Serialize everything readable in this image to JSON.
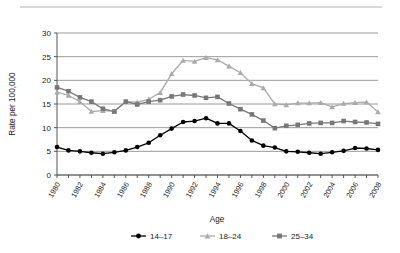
{
  "chart_data": {
    "type": "line",
    "title": "",
    "xlabel": "Age",
    "ylabel": "Rate per 100,000",
    "x": [
      1980,
      1981,
      1982,
      1983,
      1984,
      1985,
      1986,
      1987,
      1988,
      1989,
      1990,
      1991,
      1992,
      1993,
      1994,
      1995,
      1996,
      1997,
      1998,
      1999,
      2000,
      2001,
      2002,
      2003,
      2004,
      2005,
      2006,
      2007,
      2008
    ],
    "xlim": [
      1980,
      2008
    ],
    "ylim": [
      0,
      30
    ],
    "yticks": [
      0,
      5,
      10,
      15,
      20,
      25,
      30
    ],
    "xticks": [
      1980,
      1982,
      1984,
      1986,
      1988,
      1990,
      1992,
      1994,
      1996,
      1998,
      2000,
      2002,
      2004,
      2006,
      2008
    ],
    "xtick_labels": [
      "1980",
      "1982",
      "1984",
      "1986",
      "1988",
      "1990",
      "1992",
      "1994",
      "1996",
      "1998",
      "2000",
      "2002",
      "2004",
      "2006",
      "2008"
    ],
    "ytick_labels": [
      "0",
      "5",
      "10",
      "15",
      "20",
      "25",
      "30"
    ],
    "grid": "horizontal",
    "legend_position": "bottom",
    "series": [
      {
        "name": "14–17",
        "color": "#000000",
        "marker": "circle",
        "values": [
          5.9,
          5.2,
          5.0,
          4.7,
          4.5,
          4.8,
          5.2,
          5.9,
          6.8,
          8.4,
          9.8,
          11.2,
          11.4,
          12.0,
          10.9,
          10.9,
          9.3,
          7.3,
          6.2,
          5.8,
          5.0,
          4.9,
          4.7,
          4.5,
          4.8,
          5.1,
          5.7,
          5.6,
          5.3
        ]
      },
      {
        "name": "18–24",
        "color": "#aaaaaa",
        "marker": "triangle",
        "values": [
          17.5,
          16.8,
          15.5,
          13.4,
          13.6,
          13.5,
          15.5,
          15.4,
          16.0,
          17.4,
          21.4,
          24.2,
          24.0,
          24.8,
          24.3,
          23.0,
          21.6,
          19.3,
          18.4,
          15.0,
          14.8,
          15.2,
          15.2,
          15.3,
          14.4,
          15.1,
          15.3,
          15.4,
          13.3
        ]
      },
      {
        "name": "25–34",
        "color": "#777777",
        "marker": "square",
        "values": [
          18.5,
          17.7,
          16.4,
          15.5,
          14.0,
          13.4,
          15.5,
          14.9,
          15.5,
          15.8,
          16.6,
          17.0,
          16.8,
          16.3,
          16.5,
          15.1,
          13.9,
          12.8,
          11.5,
          9.9,
          10.4,
          10.6,
          10.9,
          11.0,
          11.0,
          11.4,
          11.2,
          11.1,
          10.8
        ]
      }
    ]
  },
  "axis": {
    "y_title": "Rate per 100,000",
    "x_title": "Age"
  },
  "legend": {
    "items": [
      {
        "label": "14–17"
      },
      {
        "label": "18–24"
      },
      {
        "label": "25–34"
      }
    ]
  }
}
